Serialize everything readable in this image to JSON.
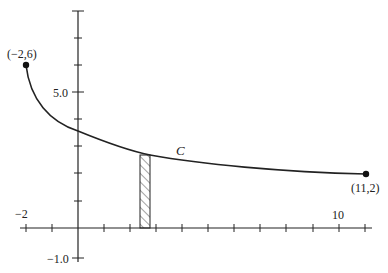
{
  "figure": {
    "type": "curve-with-area-strip",
    "curve_label": "C",
    "start_point": {
      "label": "(−2,6)",
      "x": -2,
      "y": 6
    },
    "end_point": {
      "label": "(11,2)",
      "x": 11,
      "y": 2
    },
    "axes": {
      "x_tick_labels": [
        {
          "label": "−2",
          "value": -2
        },
        {
          "label": "10",
          "value": 10
        }
      ],
      "y_tick_labels": [
        {
          "label": "5.0",
          "value": 5
        },
        {
          "label": "−1.0",
          "value": -1
        }
      ],
      "x_range": [
        -2,
        11
      ],
      "y_range": [
        -1,
        8
      ]
    },
    "strip": {
      "x_from": 2.4,
      "x_to": 2.8,
      "pattern": "hatched"
    },
    "colors": {
      "ink": "#222222",
      "background": "#ffffff"
    }
  }
}
